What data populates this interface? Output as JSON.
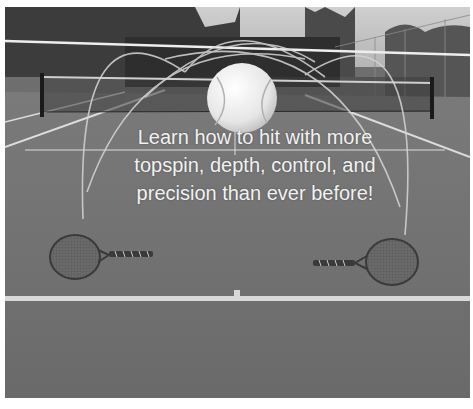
{
  "headline": {
    "lines": [
      "Learn how to hit with more",
      "topspin, depth, control, and",
      "precision than ever before!"
    ]
  },
  "scene": {
    "elements": [
      "tennis-court-photo",
      "tennis-net",
      "ball-trajectory-arcs",
      "tennis-ball",
      "left-racket",
      "right-racket",
      "baseline"
    ],
    "colors": {
      "court": "#6e6e6e",
      "sky": "#c8c8c8",
      "trees": "#3a3a3a",
      "lines": "#e0e0e0",
      "text": "#f2f2f2"
    }
  }
}
